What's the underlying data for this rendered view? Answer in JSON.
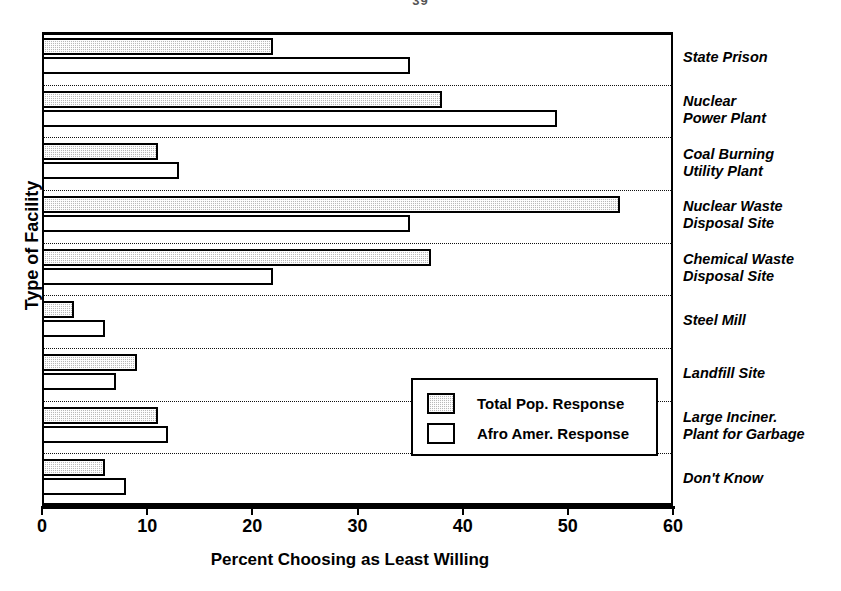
{
  "page": {
    "number": "39"
  },
  "chart_data": {
    "type": "bar",
    "orientation": "horizontal",
    "title": "",
    "xlabel": "Percent Choosing as Least Willing",
    "ylabel": "Type of Facility",
    "xlim": [
      0,
      60
    ],
    "xticks": [
      0,
      10,
      20,
      30,
      40,
      50,
      60
    ],
    "xtick_labels": [
      "0",
      "10",
      "20",
      "30",
      "40",
      "50",
      "60"
    ],
    "grid": "dotted horizontal separators between category groups",
    "legend_position": "inside lower-right",
    "categories": [
      "State Prison",
      "Nuclear\nPower Plant",
      "Coal Burning\nUtility Plant",
      "Nuclear Waste\nDisposal Site",
      "Chemical Waste\nDisposal Site",
      "Steel Mill",
      "Landfill Site",
      "Large Inciner.\nPlant for Garbage",
      "Don't Know"
    ],
    "series": [
      {
        "name": "Total Pop. Response",
        "style": "shaded",
        "color": "#b9b9b9",
        "values": [
          22,
          38,
          11,
          55,
          37,
          3,
          9,
          11,
          6
        ]
      },
      {
        "name": "Afro Amer. Response",
        "style": "white",
        "color": "#ffffff",
        "values": [
          35,
          49,
          13,
          35,
          22,
          6,
          7,
          12,
          8
        ]
      }
    ]
  }
}
